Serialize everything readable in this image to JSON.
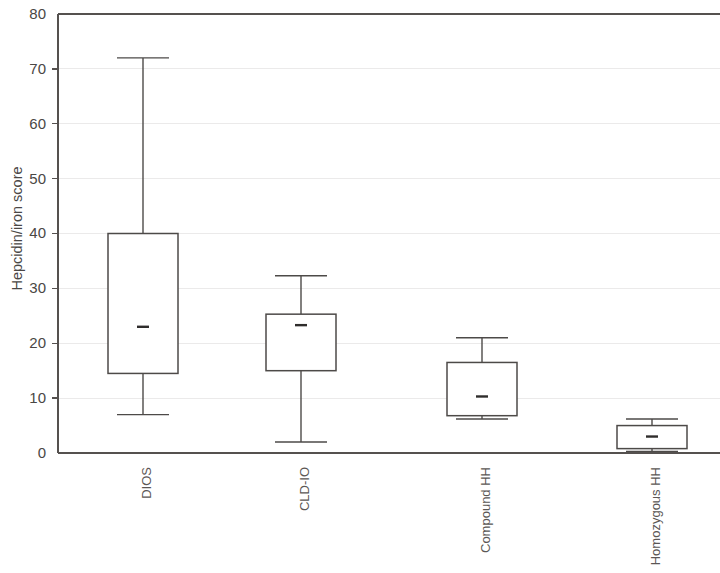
{
  "chart_data": {
    "type": "box",
    "title": "",
    "subtitle": "",
    "xlabel": "",
    "ylabel": "Hepcidin/iron score",
    "ylim": [
      0,
      80
    ],
    "yticks": [
      0,
      10,
      20,
      30,
      40,
      50,
      60,
      70,
      80
    ],
    "ytick_labels": [
      "0",
      "10",
      "20",
      "30",
      "40",
      "50",
      "60",
      "70",
      "80"
    ],
    "grid": true,
    "legend": "none",
    "categories": [
      "DIOS",
      "CLD-IO",
      "Compound HH",
      "Homozygous HH"
    ],
    "series": [
      {
        "name": "Hepcidin/iron score",
        "boxes": [
          {
            "category": "DIOS",
            "whisker_low": 7,
            "q1": 14.5,
            "median": 23,
            "q3": 40,
            "whisker_high": 72
          },
          {
            "category": "CLD-IO",
            "whisker_low": 2,
            "q1": 15,
            "median": 23.3,
            "q3": 25.3,
            "whisker_high": 32.3
          },
          {
            "category": "Compound HH",
            "whisker_low": 6.2,
            "q1": 6.8,
            "median": 10.3,
            "q3": 16.5,
            "whisker_high": 21
          },
          {
            "category": "Homozygous HH",
            "whisker_low": 0.3,
            "q1": 0.8,
            "median": 3,
            "q3": 5,
            "whisker_high": 6.2
          }
        ]
      }
    ],
    "colors": {
      "box_fill": "#ffffff",
      "box_stroke": "#4d4a48",
      "axis": "#55514f",
      "grid": "#ebeaea",
      "background": "#ffffff"
    }
  }
}
